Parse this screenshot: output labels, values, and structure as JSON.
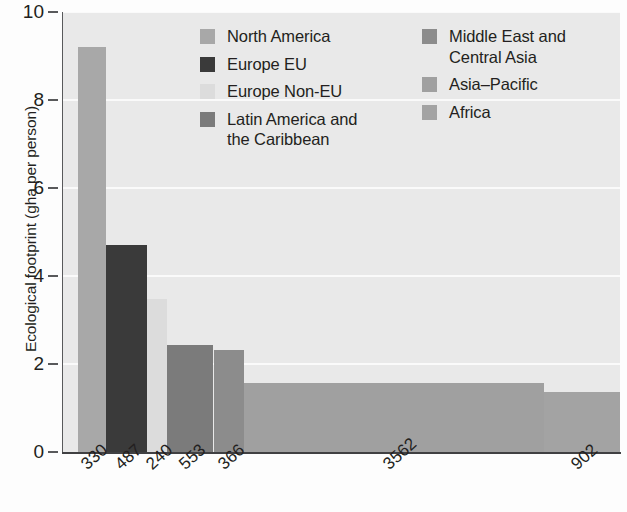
{
  "chart_data": {
    "type": "bar",
    "title": "",
    "subtitle": "",
    "xlabel": "",
    "ylabel": "Ecological footprint (gha per person)",
    "ylim": [
      0,
      10
    ],
    "yticks": [
      0,
      2,
      4,
      6,
      8,
      10
    ],
    "grid": "horizontal-white-gridlines",
    "legend_position": "inside-top-right",
    "note": "Marimekko-style bar chart: bar widths are proportional to population (millions, shown as x tick labels); bar heights are ecological footprint in gha per person.",
    "categories": [
      "North America",
      "Europe EU",
      "Europe Non-EU",
      "Latin America and the Caribbean",
      "Middle East and Central Asia",
      "Asia-Pacific",
      "Africa"
    ],
    "xtick_labels": [
      "330",
      "487",
      "240",
      "553",
      "366",
      "3562",
      "902"
    ],
    "values": [
      9.2,
      4.7,
      3.48,
      2.43,
      2.32,
      1.56,
      1.36
    ],
    "widths": [
      330,
      487,
      240,
      553,
      366,
      3562,
      902
    ],
    "colors": [
      "#a8a8a8",
      "#3a3a3a",
      "#dcdcdc",
      "#7b7b7b",
      "#8c8c8c",
      "#a0a0a0",
      "#a3a3a3"
    ],
    "bars": [
      {
        "label": "North America",
        "population": "330",
        "value": 9.2,
        "color": "#a8a8a8"
      },
      {
        "label": "Europe EU",
        "population": "487",
        "value": 4.7,
        "color": "#3a3a3a"
      },
      {
        "label": "Europe Non-EU",
        "population": "240",
        "value": 3.48,
        "color": "#dcdcdc"
      },
      {
        "label": "Latin America and the Caribbean",
        "population": "553",
        "value": 2.43,
        "color": "#7b7b7b"
      },
      {
        "label": "Middle East and Central Asia",
        "population": "366",
        "value": 2.32,
        "color": "#8c8c8c"
      },
      {
        "label": "Asia-Pacific",
        "population": "3562",
        "value": 1.56,
        "color": "#a0a0a0"
      },
      {
        "label": "Africa",
        "population": "902",
        "value": 1.36,
        "color": "#a3a3a3"
      }
    ]
  },
  "legend": {
    "columns": [
      {
        "items": [
          {
            "label": "North America",
            "color": "#a8a8a8"
          },
          {
            "label": "Europe EU",
            "color": "#3a3a3a"
          },
          {
            "label": "Europe Non-EU",
            "color": "#dcdcdc"
          },
          {
            "label": "Latin America and\nthe Caribbean",
            "color": "#7b7b7b"
          }
        ]
      },
      {
        "items": [
          {
            "label": "Middle East and\nCentral Asia",
            "color": "#8c8c8c"
          },
          {
            "label": "Asia–Pacific",
            "color": "#a0a0a0"
          },
          {
            "label": "Africa",
            "color": "#a3a3a3"
          }
        ]
      }
    ]
  },
  "axes": {
    "y_title": "Ecological footprint (gha per person)",
    "y_tick_labels": [
      "10",
      "8",
      "6",
      "4",
      "2",
      "0"
    ]
  },
  "style": {
    "plot_background": "#e9e9e9",
    "gridline_color": "#fafafa",
    "axis_color": "#58595b",
    "text_color": "#231f20",
    "page_background": "#fdfdfd"
  }
}
